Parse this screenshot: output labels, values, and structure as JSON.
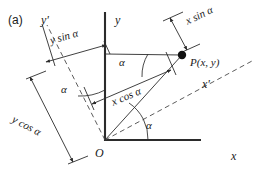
{
  "figure": {
    "panel_label": "(a)",
    "caption_present": false,
    "background_color": "#ffffff",
    "line_color": "#2b2b2b",
    "text_color": "#1a1a1a",
    "width": 261,
    "height": 181
  },
  "axes": {
    "origin_label": "O",
    "x_label": "x",
    "y_label": "y",
    "x_prime_label": "x'",
    "y_prime_label": "y'"
  },
  "point": {
    "label": "P(x, y)",
    "marker": "filled-dot"
  },
  "angles": [
    {
      "id": "angle-origin",
      "label": "α"
    },
    {
      "id": "angle-upper",
      "label": "α"
    },
    {
      "id": "angle-left",
      "label": "α"
    }
  ],
  "measurements": [
    {
      "id": "y-sin-alpha",
      "label": "y sin α"
    },
    {
      "id": "y-cos-alpha",
      "label": "y cos α"
    },
    {
      "id": "x-sin-alpha",
      "label": "x sin α"
    },
    {
      "id": "x-cos-alpha",
      "label": "x cos α"
    }
  ]
}
